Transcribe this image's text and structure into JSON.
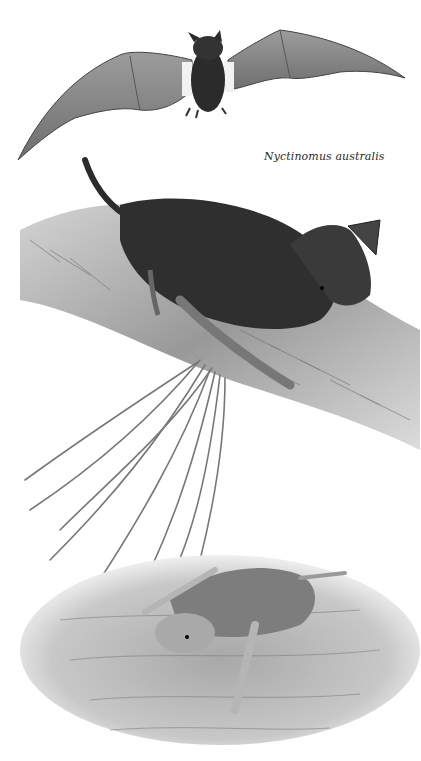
{
  "caption": "Nyctinomus australis",
  "figures": [
    {
      "name": "flying-bat",
      "description": "Bat in flight, wings spread, with white flank stripes"
    },
    {
      "name": "perched-bat",
      "description": "Dark-furred bat clinging to a tree branch with casuarina-like needles below"
    },
    {
      "name": "crawling-bat",
      "description": "Lighter bat crawling on a wooden surface"
    }
  ],
  "colors": {
    "background": "#ffffff",
    "fur_dark": "#2b2b2b",
    "wing": "#8a8a8a",
    "bark": "#9a9a9a",
    "caption": "#2a2a2a"
  }
}
